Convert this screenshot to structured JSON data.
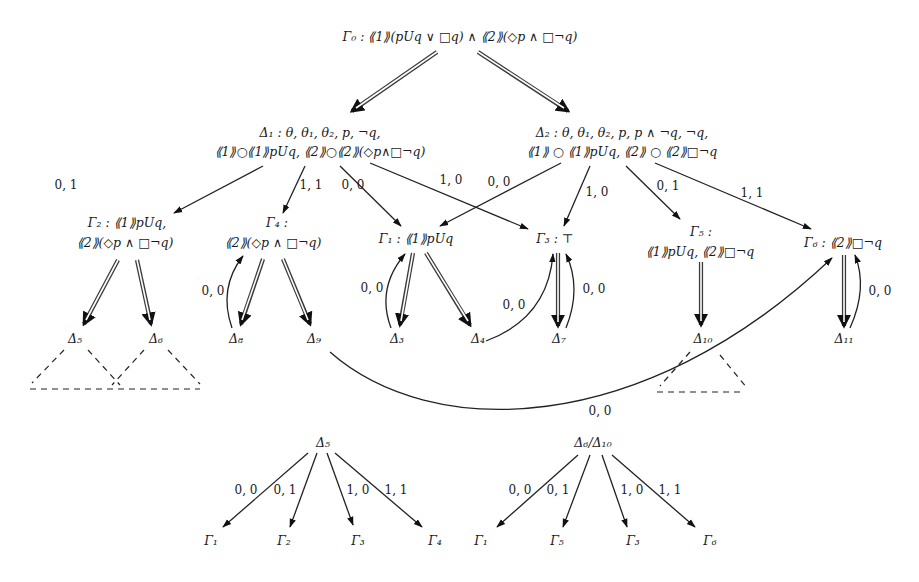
{
  "diagram": {
    "type": "tableau-graph",
    "nodes": {
      "gamma0": {
        "line1": "Γ₀ : ⟪1⟫(pUq ∨ □q) ∧ ⟪2⟫(◇p ∧ □¬q)"
      },
      "delta1": {
        "line1": "Δ₁ : θ, θ₁, θ₂, p, ¬q,",
        "line2": "⟪1⟫○⟪1⟫pUq, ⟪2⟫○⟪2⟫(◇p∧□¬q)"
      },
      "delta2": {
        "line1": "Δ₂ : θ, θ₁, θ₂, p, p ∧ ¬q, ¬q,",
        "line2": "⟪1⟫ ○ ⟪1⟫pUq, ⟪2⟫ ○ ⟪2⟫□¬q"
      },
      "gamma2": {
        "line1": "Γ₂ : ⟪1⟫pUq,",
        "line2": "⟪2⟫(◇p ∧ □¬q)"
      },
      "gamma4": {
        "line1": "Γ₄ :",
        "line2": "⟪2⟫(◇p ∧ □¬q)"
      },
      "gamma1": {
        "line1": "Γ₁ : ⟪1⟫pUq"
      },
      "gamma3": {
        "line1": "Γ₃ : ⊤"
      },
      "gamma5": {
        "line1": "Γ₅ :",
        "line2": "⟪1⟫pUq, ⟪2⟫□¬q"
      },
      "gamma6": {
        "line1": "Γ₆ : ⟪2⟫□¬q"
      },
      "delta5": {
        "line1": "Δ₅"
      },
      "delta6": {
        "line1": "Δ₆"
      },
      "delta8": {
        "line1": "Δ₈"
      },
      "delta9": {
        "line1": "Δ₉"
      },
      "delta3": {
        "line1": "Δ₃"
      },
      "delta4": {
        "line1": "Δ₄"
      },
      "delta7": {
        "line1": "Δ₇"
      },
      "delta10": {
        "line1": "Δ₁₀"
      },
      "delta11": {
        "line1": "Δ₁₁"
      }
    },
    "edges": {
      "d1_g2": "0, 1",
      "d1_g4": "1, 1",
      "d1_g1": "0, 0",
      "d1_g3": "1, 0",
      "d2_g1": "0, 0",
      "d2_g3": "1, 0",
      "d2_g5": "0, 1",
      "d2_g6": "1, 1",
      "d8_g4": "0, 0",
      "d3_g1": "0, 0",
      "d4_g3": "0, 0",
      "d7_g3": "0, 0",
      "d11_g6": "0, 0",
      "d9_g6": "0, 0"
    },
    "bottom_left": {
      "root": "Δ₅",
      "children": [
        "Γ₁",
        "Γ₂",
        "Γ₃",
        "Γ₄"
      ],
      "labels": [
        "0, 0",
        "0, 1",
        "1, 0",
        "1, 1"
      ]
    },
    "bottom_right": {
      "root": "Δ₆/Δ₁₀",
      "children": [
        "Γ₁",
        "Γ₅",
        "Γ₃",
        "Γ₆"
      ],
      "labels": [
        "0, 0",
        "0, 1",
        "1, 0",
        "1, 1"
      ]
    }
  }
}
